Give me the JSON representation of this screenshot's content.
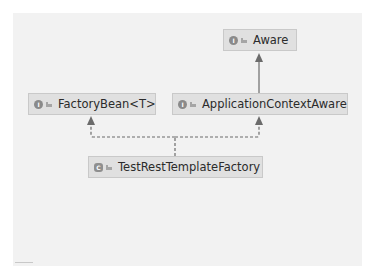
{
  "diagram": {
    "type": "uml-class-hierarchy",
    "nodes": [
      {
        "id": "aware",
        "label": "Aware",
        "kind": "interface",
        "icon": "interface-icon",
        "icon_glyph": "I"
      },
      {
        "id": "factorybean",
        "label": "FactoryBean<T>",
        "kind": "interface",
        "icon": "interface-icon",
        "icon_glyph": "I"
      },
      {
        "id": "appctxaware",
        "label": "ApplicationContextAware",
        "kind": "interface",
        "icon": "interface-icon",
        "icon_glyph": "I"
      },
      {
        "id": "testresttemplatefactory",
        "label": "TestRestTemplateFactory",
        "kind": "class",
        "icon": "class-icon",
        "icon_glyph": "C"
      }
    ],
    "edges": [
      {
        "from": "appctxaware",
        "to": "aware",
        "type": "extends",
        "style": "solid"
      },
      {
        "from": "testresttemplatefactory",
        "to": "factorybean",
        "type": "implements",
        "style": "dashed"
      },
      {
        "from": "testresttemplatefactory",
        "to": "appctxaware",
        "type": "implements",
        "style": "dashed"
      }
    ],
    "colors": {
      "canvas_bg": "#f2f2f2",
      "node_bg": "#e0e0e0",
      "node_border": "#c9c9c9",
      "edge": "#6b6b6b",
      "text": "#2b2b2b"
    }
  }
}
